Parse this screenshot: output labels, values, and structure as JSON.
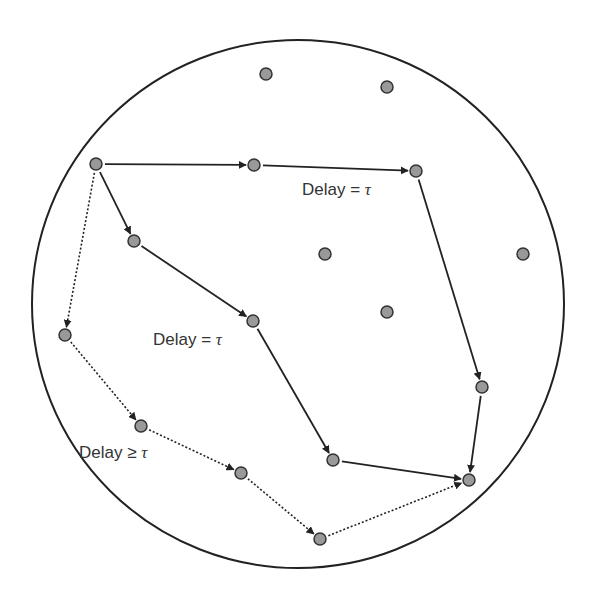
{
  "diagram": {
    "type": "network-paths",
    "boundary": {
      "cx": 298,
      "cy": 304,
      "rx": 266,
      "ry": 264,
      "stroke": "#222222"
    },
    "node_style": {
      "fill": "#999999",
      "stroke": "#333333",
      "r": 6
    },
    "nodes": [
      {
        "id": "n1",
        "x": 266,
        "y": 74
      },
      {
        "id": "n2",
        "x": 387,
        "y": 87
      },
      {
        "id": "src",
        "x": 96,
        "y": 164
      },
      {
        "id": "a1",
        "x": 254,
        "y": 165
      },
      {
        "id": "a2",
        "x": 416,
        "y": 171
      },
      {
        "id": "b1",
        "x": 134,
        "y": 241
      },
      {
        "id": "n3",
        "x": 325,
        "y": 254
      },
      {
        "id": "n4",
        "x": 523,
        "y": 254
      },
      {
        "id": "n5",
        "x": 387,
        "y": 312
      },
      {
        "id": "b2",
        "x": 253,
        "y": 321
      },
      {
        "id": "c1",
        "x": 65,
        "y": 335
      },
      {
        "id": "a3",
        "x": 482,
        "y": 387
      },
      {
        "id": "c2",
        "x": 141,
        "y": 426
      },
      {
        "id": "b3",
        "x": 333,
        "y": 460
      },
      {
        "id": "c3",
        "x": 241,
        "y": 473
      },
      {
        "id": "dst",
        "x": 469,
        "y": 480
      },
      {
        "id": "c4",
        "x": 320,
        "y": 539
      }
    ],
    "edges": [
      {
        "from": "src",
        "to": "a1",
        "style": "solid"
      },
      {
        "from": "a1",
        "to": "a2",
        "style": "solid"
      },
      {
        "from": "a2",
        "to": "a3",
        "style": "solid"
      },
      {
        "from": "a3",
        "to": "dst",
        "style": "solid"
      },
      {
        "from": "src",
        "to": "b1",
        "style": "solid"
      },
      {
        "from": "b1",
        "to": "b2",
        "style": "solid"
      },
      {
        "from": "b2",
        "to": "b3",
        "style": "solid"
      },
      {
        "from": "b3",
        "to": "dst",
        "style": "solid"
      },
      {
        "from": "src",
        "to": "c1",
        "style": "dotted"
      },
      {
        "from": "c1",
        "to": "c2",
        "style": "dotted"
      },
      {
        "from": "c2",
        "to": "c3",
        "style": "dotted"
      },
      {
        "from": "c3",
        "to": "c4",
        "style": "dotted"
      },
      {
        "from": "c4",
        "to": "dst",
        "style": "dotted"
      }
    ],
    "labels": [
      {
        "id": "upper-path-label",
        "text": "Delay = ",
        "symbol": "τ",
        "x": 302,
        "y": 190
      },
      {
        "id": "middle-path-label",
        "text": "Delay = ",
        "symbol": "τ",
        "x": 153,
        "y": 340
      },
      {
        "id": "lower-path-label",
        "text": "Delay ≥ ",
        "symbol": "τ",
        "x": 79,
        "y": 453
      }
    ]
  }
}
